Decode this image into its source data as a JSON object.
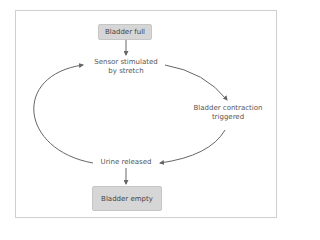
{
  "diagram": {
    "type": "cycle-flowchart",
    "start_box": {
      "label": "Bladder full"
    },
    "end_box": {
      "label": "Bladder empty"
    },
    "cycle_nodes": [
      {
        "id": "sensor",
        "line1": "Sensor stimulated",
        "line2": "by stretch"
      },
      {
        "id": "contraction",
        "line1": "Bladder contraction",
        "line2": "triggered"
      },
      {
        "id": "release",
        "line1": "Urine released"
      }
    ],
    "edges": [
      {
        "from": "Bladder full",
        "to": "Sensor stimulated by stretch"
      },
      {
        "from": "Sensor stimulated by stretch",
        "to": "Bladder contraction triggered"
      },
      {
        "from": "Bladder contraction triggered",
        "to": "Urine released"
      },
      {
        "from": "Urine released",
        "to": "Sensor stimulated by stretch"
      },
      {
        "from": "Urine released",
        "to": "Bladder empty"
      }
    ],
    "colors": {
      "box_fill": "#d6d6d6",
      "arrow": "#666666",
      "frame": "#cfcfcf"
    }
  }
}
